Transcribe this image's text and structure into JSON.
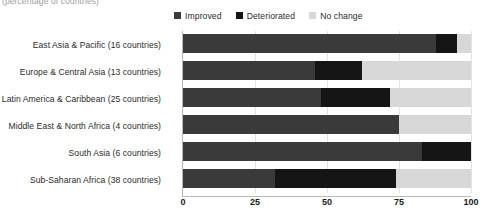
{
  "subtitle": "(percentage of countries)",
  "colors": {
    "improved": "#3a3a3a",
    "deteriorated": "#151515",
    "no_change": "#d7d7d7",
    "gridline": "#e3e3e3",
    "axis": "#b9b9b9",
    "text": "#2b2b2b",
    "subtitle_text": "#9aa0a6"
  },
  "legend": {
    "items": [
      {
        "label": "Improved",
        "color": "#3a3a3a",
        "swatch": "legend-swatch-improved"
      },
      {
        "label": "Deteriorated",
        "color": "#151515",
        "swatch": "legend-swatch-deteriorated"
      },
      {
        "label": "No change",
        "color": "#d7d7d7",
        "swatch": "legend-swatch-no-change"
      }
    ]
  },
  "chart_data": {
    "type": "bar",
    "orientation": "horizontal",
    "stacked": true,
    "title": "",
    "subtitle": "(percentage of countries)",
    "xlabel": "",
    "ylabel": "",
    "xlim": [
      0,
      100
    ],
    "xticks": [
      0,
      25,
      50,
      75,
      100
    ],
    "xticklabels": [
      "0",
      "25",
      "50",
      "75",
      "100"
    ],
    "grid": true,
    "grid_axis": "x",
    "legend_position": "top",
    "categories": [
      "East Asia & Pacific (16 countries)",
      "Europe & Central Asia (13 countries)",
      "Latin America & Caribbean (25 countries)",
      "Middle East & North Africa (4 countries)",
      "South Asia (6 countries)",
      "Sub-Saharan Africa (38 countries)"
    ],
    "series": [
      {
        "name": "Improved",
        "color": "#3a3a3a",
        "values": [
          88,
          46,
          48,
          75,
          83,
          32
        ]
      },
      {
        "name": "Deteriorated",
        "color": "#151515",
        "values": [
          7,
          16,
          24,
          0,
          17,
          42
        ]
      },
      {
        "name": "No change",
        "color": "#d7d7d7",
        "values": [
          5,
          38,
          28,
          25,
          0,
          26
        ]
      }
    ]
  }
}
